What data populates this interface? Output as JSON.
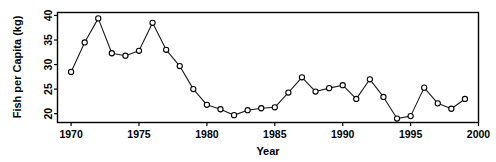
{
  "chart_data": {
    "type": "line",
    "title": "",
    "xlabel": "Year",
    "ylabel": "Fish per Capita  (kg)",
    "xlim": [
      1969,
      2000
    ],
    "ylim": [
      18.2,
      40.6
    ],
    "xticks": [
      1970,
      1975,
      1980,
      1985,
      1990,
      1995,
      2000
    ],
    "xtick_labels": [
      "1970",
      "1975",
      "1980",
      "1985",
      "1990",
      "1995",
      "2000"
    ],
    "yticks": [
      20,
      25,
      30,
      35,
      40
    ],
    "ytick_labels": [
      "20",
      "25",
      "30",
      "35",
      "40"
    ],
    "grid": false,
    "legend": "none",
    "marker": "open-circle",
    "line_color": "#1a1a1a",
    "marker_fill": "#ffffff",
    "marker_edge": "#000000",
    "background": "#ffffff",
    "x": [
      1970,
      1971,
      1972,
      1973,
      1974,
      1975,
      1976,
      1977,
      1978,
      1979,
      1980,
      1981,
      1982,
      1983,
      1984,
      1985,
      1986,
      1987,
      1988,
      1989,
      1990,
      1991,
      1992,
      1993,
      1994,
      1995,
      1996,
      1997,
      1998,
      1999
    ],
    "values": [
      28.5,
      34.5,
      39.4,
      32.3,
      31.8,
      32.8,
      38.5,
      33.0,
      29.7,
      25.0,
      21.8,
      20.9,
      19.7,
      20.7,
      21.1,
      21.3,
      24.3,
      27.4,
      24.5,
      25.2,
      25.8,
      23.0,
      27.0,
      23.4,
      19.0,
      19.5,
      25.3,
      22.1,
      21.0,
      23.0
    ],
    "series": [
      {
        "name": "Fish per Capita",
        "values": [
          28.5,
          34.5,
          39.4,
          32.3,
          31.8,
          32.8,
          38.5,
          33.0,
          29.7,
          25.0,
          21.8,
          20.9,
          19.7,
          20.7,
          21.1,
          21.3,
          24.3,
          27.4,
          24.5,
          25.2,
          25.8,
          23.0,
          27.0,
          23.4,
          19.0,
          19.5,
          25.3,
          22.1,
          21.0,
          23.0
        ]
      }
    ]
  }
}
